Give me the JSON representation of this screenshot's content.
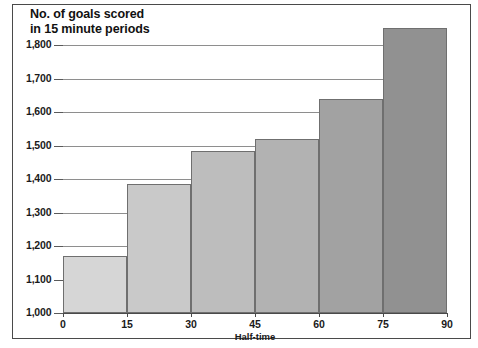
{
  "chart_data": {
    "type": "bar",
    "title": "No. of goals scored in 15 minute periods",
    "title_lines": [
      "No. of goals scored",
      "in 15 minute periods"
    ],
    "xlabel": "",
    "ylabel": "",
    "categories": [
      "0-15",
      "15-30",
      "30-45",
      "45-60",
      "60-75",
      "75-90"
    ],
    "x_interval_starts": [
      0,
      15,
      30,
      45,
      60,
      75
    ],
    "values": [
      1170,
      1385,
      1485,
      1520,
      1640,
      1850
    ],
    "bar_colors": [
      "#d6d6d6",
      "#c9c9c9",
      "#bdbdbd",
      "#b2b2b2",
      "#a2a2a2",
      "#919191"
    ],
    "bar_border_color": "#6f6f6f",
    "xlim": [
      0,
      90
    ],
    "ylim": [
      1000,
      1800
    ],
    "x_ticks": [
      "0",
      "15",
      "30",
      "45",
      "60",
      "75",
      "90"
    ],
    "x_tick_values": [
      0,
      15,
      30,
      45,
      60,
      75,
      90
    ],
    "y_ticks": [
      "1,000",
      "1,100",
      "1,200",
      "1,300",
      "1,400",
      "1,500",
      "1,600",
      "1,700",
      "1,800"
    ],
    "y_tick_values": [
      1000,
      1100,
      1200,
      1300,
      1400,
      1500,
      1600,
      1700,
      1800
    ],
    "grid": true,
    "grid_color": "#8e8e8e",
    "legend": null,
    "annotations": [
      {
        "text": "Half-time",
        "x_value": 45,
        "position": "below-axis"
      }
    ],
    "background": "#ffffff",
    "frame_color": "#4a4a4a"
  }
}
